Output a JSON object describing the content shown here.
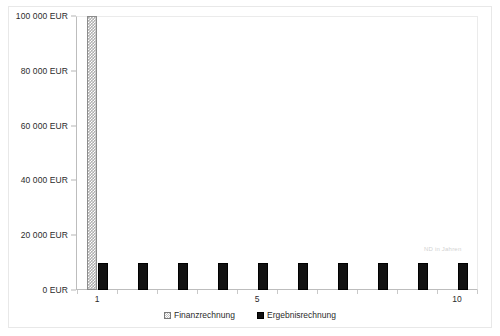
{
  "chart_data": {
    "type": "bar",
    "title": "",
    "subtitle": "",
    "xlabel": "ND in Jahren",
    "ylabel": "",
    "grid": false,
    "legend_position": "bottom-center",
    "categories": [
      "1",
      "2",
      "3",
      "4",
      "5",
      "6",
      "7",
      "8",
      "9",
      "10"
    ],
    "x_tick_labels_shown": [
      "1",
      "5",
      "10"
    ],
    "ylim": [
      0,
      100000
    ],
    "y_tick_values": [
      0,
      20000,
      40000,
      60000,
      80000,
      100000
    ],
    "y_tick_labels": [
      "0 EUR",
      "20 000 EUR",
      "40 000 EUR",
      "60 000 EUR",
      "80 000 EUR",
      "100 000 EUR"
    ],
    "series": [
      {
        "name": "Finanzrechnung",
        "color": "#b0b0b0",
        "pattern": "checkered",
        "values": [
          100000,
          0,
          0,
          0,
          0,
          0,
          0,
          0,
          0,
          0
        ]
      },
      {
        "name": "Ergebnisrechnung",
        "color": "#111111",
        "pattern": "solid",
        "values": [
          10000,
          10000,
          10000,
          10000,
          10000,
          10000,
          10000,
          10000,
          10000,
          10000
        ]
      }
    ]
  },
  "legend": {
    "entries": [
      {
        "label": "Finanzrechnung"
      },
      {
        "label": "Ergebnisrechnung"
      }
    ]
  }
}
